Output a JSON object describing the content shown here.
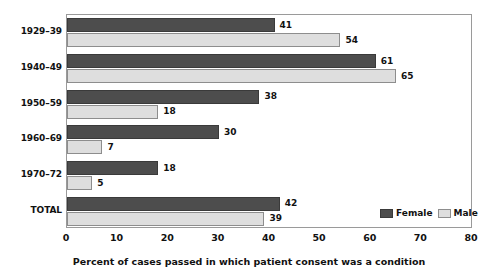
{
  "chart_data": {
    "type": "bar",
    "orientation": "horizontal",
    "title": "",
    "caption": "Percent of cases passed in which patient consent was a condition",
    "xlabel": "",
    "ylabel": "",
    "xlim": [
      0,
      80
    ],
    "xticks": [
      0,
      10,
      20,
      30,
      40,
      50,
      60,
      70,
      80
    ],
    "xtick_labels": [
      "0",
      "10",
      "20",
      "30",
      "40",
      "50",
      "60",
      "70",
      "80"
    ],
    "grid": false,
    "legend_position": "bottom-right",
    "categories": [
      "1929–39",
      "1940–49",
      "1950–59",
      "1960–69",
      "1970–72",
      "TOTAL"
    ],
    "series": [
      {
        "name": "Female",
        "color": "#4d4d4d",
        "values": [
          41,
          61,
          38,
          30,
          18,
          42
        ]
      },
      {
        "name": "Male",
        "color": "#dedede",
        "values": [
          54,
          65,
          18,
          7,
          5,
          39
        ]
      }
    ]
  },
  "legend": {
    "entries": [
      {
        "label": "Female"
      },
      {
        "label": "Male"
      }
    ]
  },
  "colors": {
    "female": "#4d4d4d",
    "male": "#dedede",
    "frame": "#9a9a9a",
    "text": "#111111"
  }
}
